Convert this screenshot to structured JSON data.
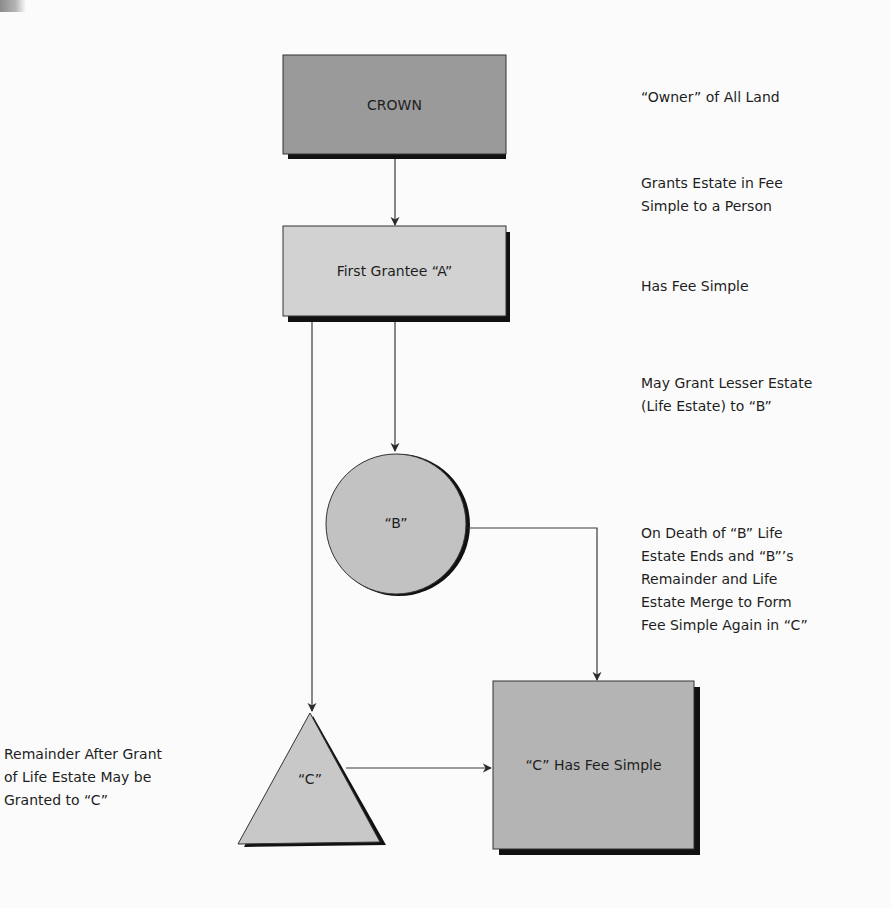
{
  "diagram": {
    "nodes": {
      "crown": {
        "label": "CROWN",
        "shape": "rectangle",
        "fill": "#9a9a9a"
      },
      "first_grantee": {
        "label": "First Grantee “A”",
        "shape": "rectangle",
        "fill": "#d2d2d2"
      },
      "b": {
        "label": "“B”",
        "shape": "circle",
        "fill": "#c2c2c2"
      },
      "c_triangle": {
        "label": "“C”",
        "shape": "triangle",
        "fill": "#c8c8c8"
      },
      "c_fee_simple": {
        "label": "“C” Has Fee Simple",
        "shape": "rectangle",
        "fill": "#b4b4b4"
      }
    },
    "annotations": {
      "owner": "“Owner” of All Land",
      "grants": "Grants Estate in Fee\nSimple to a Person",
      "has_fee": "Has Fee Simple",
      "may_grant": "May Grant Lesser Estate\n(Life Estate) to “B”",
      "on_death": "On Death of “B” Life\nEstate Ends and “B”’s\nRemainder and Life\nEstate Merge to Form\nFee Simple Again in “C”",
      "remainder": "Remainder After Grant\nof Life Estate May be\nGranted to “C”"
    },
    "edges": [
      {
        "from": "crown",
        "to": "first_grantee"
      },
      {
        "from": "first_grantee",
        "to": "b"
      },
      {
        "from": "first_grantee",
        "to": "c_triangle"
      },
      {
        "from": "b",
        "to": "c_fee_simple"
      },
      {
        "from": "c_triangle",
        "to": "c_fee_simple"
      }
    ],
    "colors": {
      "line": "#3a3a3a",
      "shadow": "#111111",
      "background": "#fbfbfb"
    }
  }
}
